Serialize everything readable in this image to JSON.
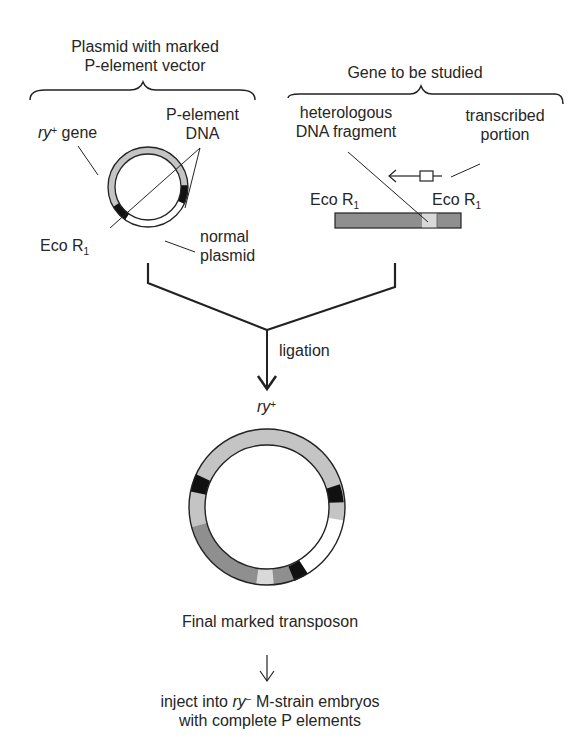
{
  "left_group": {
    "title_line1": "Plasmid with marked",
    "title_line2": "P-element vector",
    "ry_gene_label_prefix": "ry",
    "ry_gene_label_sup": "+",
    "ry_gene_label_suffix": " gene",
    "p_element_line1": "P-element",
    "p_element_line2": "DNA",
    "eco_label": "Eco R",
    "eco_sub": "1",
    "normal_line1": "normal",
    "normal_line2": "plasmid"
  },
  "right_group": {
    "title": "Gene to be studied",
    "hetero_line1": "heterologous",
    "hetero_line2": "DNA fragment",
    "transcribed_line1": "transcribed",
    "transcribed_line2": "portion",
    "eco_left_label": "Eco R",
    "eco_left_sub": "1",
    "eco_right_label": "Eco R",
    "eco_right_sub": "1"
  },
  "ligation": {
    "label": "ligation",
    "ry_prefix": "ry",
    "ry_sup": "+"
  },
  "final": {
    "label": "Final marked transposon",
    "inject_prefix": "inject into ",
    "inject_ry": "ry",
    "inject_sup": "−",
    "inject_suffix": " M-strain embryos",
    "inject_line2": "with complete P elements"
  },
  "colors": {
    "ry_gene_gray": "#c4c4c4",
    "fragment_gray": "#8f8f8f",
    "transcribed_light": "#d9d9d9",
    "p_element_black": "#111111",
    "plasmid_white": "#ffffff",
    "line": "#222222"
  }
}
